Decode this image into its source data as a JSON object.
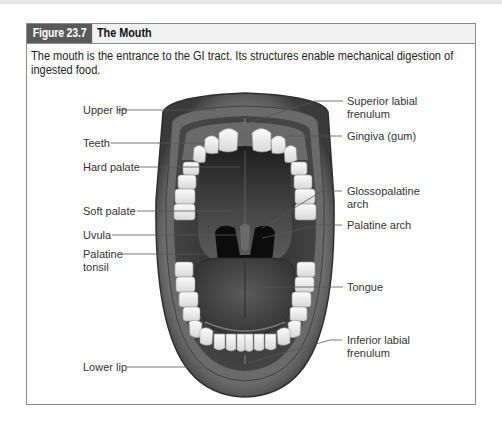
{
  "figure": {
    "number": "Figure 23.7",
    "title": "The Mouth",
    "caption": "The mouth is the entrance to the GI tract. Its structures enable mechanical digestion of ingested food."
  },
  "labels": {
    "left": [
      {
        "id": "upper-lip",
        "text": "Upper lip"
      },
      {
        "id": "teeth",
        "text": "Teeth"
      },
      {
        "id": "hard-palate",
        "text": "Hard palate"
      },
      {
        "id": "soft-palate",
        "text": "Soft palate"
      },
      {
        "id": "uvula",
        "text": "Uvula"
      },
      {
        "id": "palatine-tonsil",
        "text": "Palatine tonsil",
        "line1": "Palatine",
        "line2": "tonsil"
      },
      {
        "id": "lower-lip",
        "text": "Lower lip"
      }
    ],
    "right": [
      {
        "id": "superior-labial-frenulum",
        "text": "Superior labial frenulum",
        "line1": "Superior labial",
        "line2": "frenulum"
      },
      {
        "id": "gingiva",
        "text": "Gingiva (gum)"
      },
      {
        "id": "glossopalatine-arch",
        "text": "Glossopalatine arch",
        "line1": "Glossopalatine",
        "line2": "arch"
      },
      {
        "id": "palatine-arch",
        "text": "Palatine arch"
      },
      {
        "id": "tongue",
        "text": "Tongue"
      },
      {
        "id": "inferior-labial-frenulum",
        "text": "Inferior labial frenulum",
        "line1": "Inferior labial",
        "line2": "frenulum"
      }
    ]
  },
  "colors": {
    "header_tab": "#5a5a5a",
    "header_bg": "#f2f2f2",
    "border": "#8a8a8a"
  }
}
